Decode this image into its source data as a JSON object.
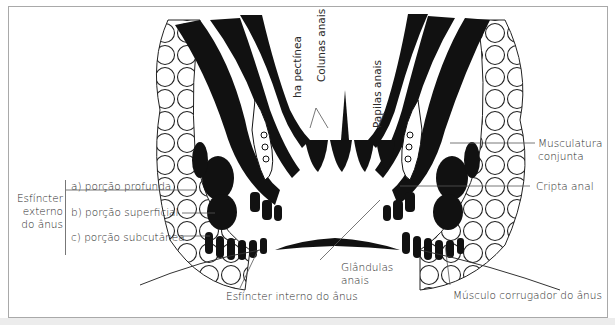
{
  "figure": {
    "colors": {
      "ink": "#111111",
      "frame": "#a9a9a9",
      "text": "#2a2a2a",
      "band": "#ececec"
    }
  },
  "labels": {
    "esfincter_externo": {
      "group_label_line1": "Esfíncter",
      "group_label_line2": "externo",
      "group_label_line3": "do ânus",
      "parts": [
        {
          "label": "a) porção profunda"
        },
        {
          "label": "b) porção superficial"
        },
        {
          "label": "c) porção subcutânea"
        }
      ]
    },
    "linha_pectinea": "Linha pectínea",
    "linha_pectinea_visible": "ha pectínea",
    "colunas_anais": "Colunas anais",
    "papilas_anais": "Papilas anais",
    "musculatura_conjunta_line1": "Musculatura",
    "musculatura_conjunta_line2": "conjunta",
    "cripta_anal": "Cripta anal",
    "glandulas_anais_line1": "Glândulas",
    "glandulas_anais_line2": "anais",
    "esfincter_interno": "Esfíncter interno do ânus",
    "musculo_corrugador": "Músculo corrugador do ânus"
  }
}
